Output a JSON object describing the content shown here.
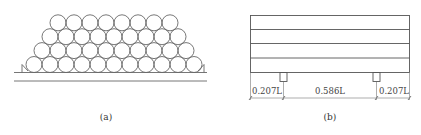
{
  "panel_a": {
    "caption": "(a)",
    "rows": [
      8,
      9,
      10,
      11
    ],
    "description": "stack of cylindrical logs on ground with wedge chocks"
  },
  "panel_b": {
    "caption": "(b)",
    "layers": 4,
    "dimensions": [
      {
        "label": "0.207L",
        "value": 0.207
      },
      {
        "label": "0.586L",
        "value": 0.586
      },
      {
        "label": "0.207L",
        "value": 0.207
      }
    ]
  },
  "colors": {
    "stroke": "#555555",
    "text": "#444444"
  }
}
